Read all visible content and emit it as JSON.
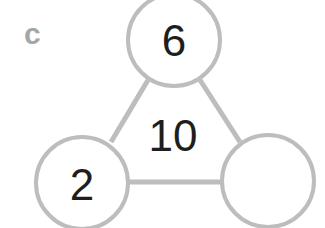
{
  "problem_label": "c",
  "diagram": {
    "type": "number-triangle",
    "center_total": "10",
    "nodes": [
      {
        "position": "top",
        "value": "6"
      },
      {
        "position": "bottom-left",
        "value": "2"
      },
      {
        "position": "bottom-right",
        "value": ""
      }
    ],
    "colors": {
      "stroke": "#bdbdbd",
      "text": "#1e1e1e",
      "label": "#a6a6a6"
    }
  }
}
